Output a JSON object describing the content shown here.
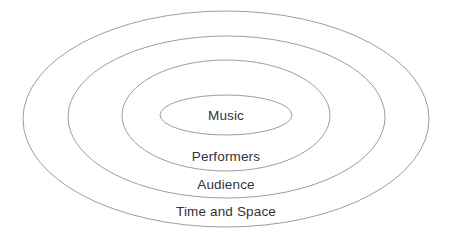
{
  "diagram": {
    "type": "concentric-ellipses",
    "title": "",
    "background_color": "#ffffff",
    "stroke_color": "#9d9d9d",
    "text_color": "#333333",
    "canvas": {
      "width": 452,
      "height": 241
    },
    "rings": [
      {
        "index": 0,
        "level": "outermost",
        "label": "Time and Space",
        "cx": 226,
        "cy": 119,
        "rx": 203,
        "ry": 108,
        "label_x": 226,
        "label_y": 216
      },
      {
        "index": 1,
        "level": "third",
        "label": "Audience",
        "cx": 226.5,
        "cy": 117,
        "rx": 158.5,
        "ry": 81,
        "label_x": 226,
        "label_y": 189
      },
      {
        "index": 2,
        "level": "second",
        "label": "Performers",
        "cx": 226,
        "cy": 115.5,
        "rx": 104,
        "ry": 55.5,
        "label_x": 226,
        "label_y": 161
      },
      {
        "index": 3,
        "level": "innermost",
        "label": "Music",
        "cx": 226,
        "cy": 115,
        "rx": 66,
        "ry": 20,
        "label_x": 226,
        "label_y": 120
      }
    ]
  }
}
